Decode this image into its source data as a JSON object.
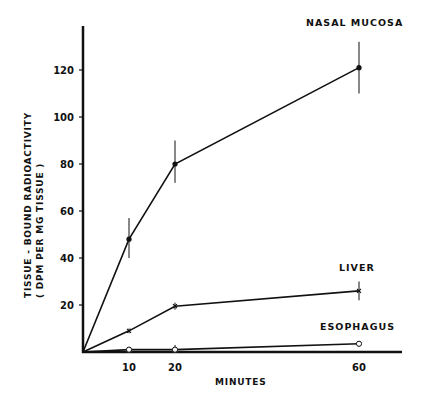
{
  "chart_data": {
    "type": "line",
    "title": "",
    "xlabel": "MINUTES",
    "ylabel": "TISSUE - BOUND RADIOACTIVITY",
    "ylabel_sub": "(DPM PER MG TISSUE)",
    "xlim": [
      0,
      68
    ],
    "ylim": [
      0,
      140
    ],
    "x_ticks": [
      10,
      20,
      60
    ],
    "y_ticks": [
      20,
      40,
      60,
      80,
      100,
      120
    ],
    "grid": false,
    "legend": "inline labels at right",
    "x": [
      0,
      10,
      20,
      60
    ],
    "series": [
      {
        "name": "NASAL MUCOSA",
        "marker": "filled-circle",
        "values": [
          0,
          48,
          80,
          121
        ],
        "error_low": [
          0,
          40,
          72,
          110
        ],
        "error_high": [
          0,
          57,
          90,
          132
        ]
      },
      {
        "name": "LIVER",
        "marker": "x",
        "values": [
          0,
          9,
          19.5,
          26
        ],
        "error_low": [
          0,
          8,
          18,
          22
        ],
        "error_high": [
          0,
          10,
          21,
          30
        ]
      },
      {
        "name": "ESOPHAGUS",
        "marker": "open-circle",
        "values": [
          0,
          1,
          1,
          3.5
        ],
        "error_low": [
          0,
          0.5,
          0,
          2.5
        ],
        "error_high": [
          0,
          1.5,
          3,
          4.5
        ]
      }
    ]
  },
  "labels": {
    "nasal": "NASAL MUCOSA",
    "liver": "LIVER",
    "esophagus": "ESOPHAGUS",
    "xlabel": "MINUTES",
    "ylabel": "TISSUE - BOUND   RADIOACTIVITY",
    "ylabel_sub": "( DPM   PER   MG  TISSUE )"
  },
  "colors": {
    "ink": "#111111",
    "background": "#ffffff"
  }
}
